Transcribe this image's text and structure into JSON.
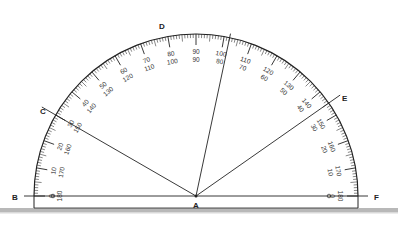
{
  "diagram": {
    "type": "protractor",
    "center_point": "A",
    "points": [
      {
        "name": "B",
        "angle_deg": 180
      },
      {
        "name": "C",
        "angle_deg": 150
      },
      {
        "name": "D",
        "angle_deg": 78
      },
      {
        "name": "E",
        "angle_deg": 35
      },
      {
        "name": "F",
        "angle_deg": 0
      }
    ],
    "scale": {
      "min": 0,
      "max": 180,
      "major_step": 10,
      "minor_step": 1
    }
  },
  "labels": {
    "A": "A",
    "B": "B",
    "C": "C",
    "D": "D",
    "E": "E",
    "F": "F"
  },
  "colors": {
    "ink": "#222222",
    "floor": "#b5b5b5",
    "background": "#ffffff"
  }
}
